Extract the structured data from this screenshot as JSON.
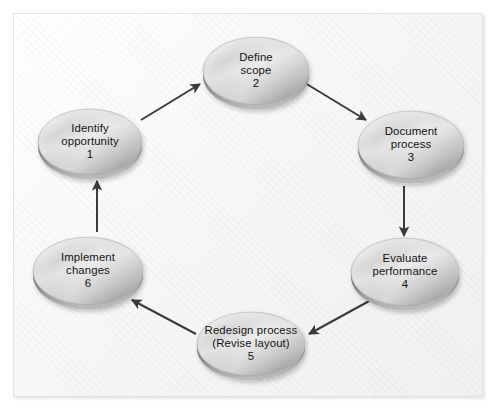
{
  "diagram": {
    "type": "cycle",
    "title": "",
    "background": "#fafafa",
    "node_fill_light": "#ededed",
    "node_fill_dark": "#9a9a9a",
    "arrow_color": "#3a3a3a",
    "text_color": "#141414",
    "direction": "clockwise",
    "nodes": [
      {
        "id": "identify-opportunity",
        "number": "1",
        "line1": "Identify",
        "line2": "opportunity",
        "line3": "",
        "cx": 90,
        "cy": 142,
        "rx": 52,
        "ry": 33
      },
      {
        "id": "define-scope",
        "number": "2",
        "line1": "Define",
        "line2": "scope",
        "line3": "",
        "cx": 256,
        "cy": 71,
        "rx": 53,
        "ry": 34
      },
      {
        "id": "document-process",
        "number": "3",
        "line1": "Document",
        "line2": "process",
        "line3": "",
        "cx": 411,
        "cy": 145,
        "rx": 53,
        "ry": 34
      },
      {
        "id": "evaluate-performance",
        "number": "4",
        "line1": "Evaluate",
        "line2": "performance",
        "line3": "",
        "cx": 405,
        "cy": 272,
        "rx": 54,
        "ry": 34
      },
      {
        "id": "redesign-process",
        "number": "5",
        "line1": "Redesign process",
        "line2": "(Revise layout)",
        "line3": "",
        "cx": 251,
        "cy": 344,
        "rx": 54,
        "ry": 32
      },
      {
        "id": "implement-changes",
        "number": "6",
        "line1": "Implement",
        "line2": "changes",
        "line3": "",
        "cx": 88,
        "cy": 271,
        "rx": 55,
        "ry": 34
      }
    ],
    "arrows": [
      {
        "id": "arrow-1-to-2",
        "from": "identify-opportunity",
        "to": "define-scope",
        "x1": 141,
        "y1": 120,
        "x2": 200,
        "y2": 84
      },
      {
        "id": "arrow-2-to-3",
        "from": "define-scope",
        "to": "document-process",
        "x1": 305,
        "y1": 83,
        "x2": 366,
        "y2": 120
      },
      {
        "id": "arrow-3-to-4",
        "from": "document-process",
        "to": "evaluate-performance",
        "x1": 404,
        "y1": 186,
        "x2": 404,
        "y2": 236
      },
      {
        "id": "arrow-4-to-5",
        "from": "evaluate-performance",
        "to": "redesign-process",
        "x1": 371,
        "y1": 300,
        "x2": 309,
        "y2": 334
      },
      {
        "id": "arrow-5-to-6",
        "from": "redesign-process",
        "to": "implement-changes",
        "x1": 196,
        "y1": 334,
        "x2": 132,
        "y2": 300
      },
      {
        "id": "arrow-6-to-1",
        "from": "implement-changes",
        "to": "identify-opportunity",
        "x1": 97,
        "y1": 232,
        "x2": 97,
        "y2": 181
      }
    ]
  }
}
